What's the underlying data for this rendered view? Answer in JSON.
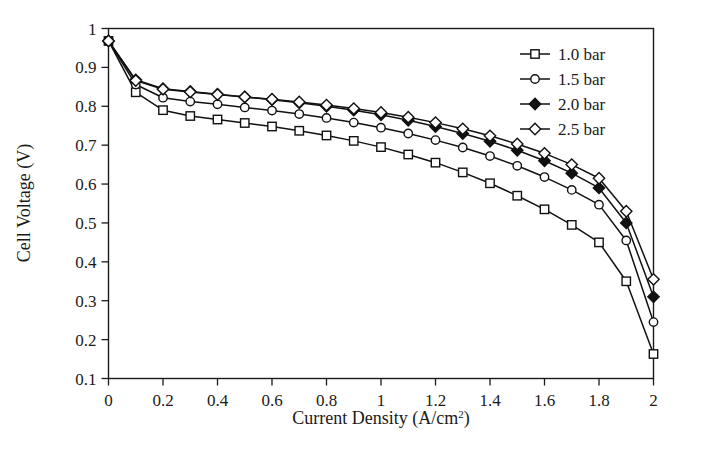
{
  "chart_data": {
    "type": "line",
    "title": "",
    "xlabel": "Current Density (A/cm2)",
    "xlabel_main": "Current Density (A/cm",
    "xlabel_sup": "2",
    "xlabel_tail": ")",
    "ylabel": "Cell Voltage (V)",
    "xlim": [
      0,
      2
    ],
    "ylim": [
      0.1,
      1
    ],
    "grid": false,
    "legend_position": "top-right",
    "xticks": [
      "0",
      "0.2",
      "0.4",
      "0.6",
      "0.8",
      "1",
      "1.2",
      "1.4",
      "1.6",
      "1.8",
      "2"
    ],
    "xtick_values": [
      0,
      0.2,
      0.4,
      0.6,
      0.8,
      1,
      1.2,
      1.4,
      1.6,
      1.8,
      2
    ],
    "yticks": [
      "0.1",
      "0.2",
      "0.3",
      "0.4",
      "0.5",
      "0.6",
      "0.7",
      "0.8",
      "0.9",
      "1"
    ],
    "ytick_values": [
      0.1,
      0.2,
      0.3,
      0.4,
      0.5,
      0.6,
      0.7,
      0.8,
      0.9,
      1
    ],
    "x": [
      0,
      0.1,
      0.2,
      0.3,
      0.4,
      0.5,
      0.6,
      0.7,
      0.8,
      0.9,
      1.0,
      1.1,
      1.2,
      1.3,
      1.4,
      1.5,
      1.6,
      1.7,
      1.8,
      1.9,
      2.0
    ],
    "series": [
      {
        "name": "1.0 bar",
        "marker": "open-square",
        "values": [
          0.968,
          0.836,
          0.79,
          0.775,
          0.766,
          0.757,
          0.748,
          0.737,
          0.725,
          0.711,
          0.695,
          0.676,
          0.655,
          0.63,
          0.602,
          0.57,
          0.535,
          0.495,
          0.45,
          0.35,
          0.163
        ]
      },
      {
        "name": "1.5 bar",
        "marker": "open-circle",
        "values": [
          0.968,
          0.856,
          0.822,
          0.812,
          0.805,
          0.797,
          0.789,
          0.78,
          0.77,
          0.758,
          0.745,
          0.73,
          0.713,
          0.694,
          0.672,
          0.647,
          0.618,
          0.585,
          0.547,
          0.455,
          0.245
        ]
      },
      {
        "name": "2.0 bar",
        "marker": "filled-diamond",
        "values": [
          0.968,
          0.868,
          0.845,
          0.838,
          0.831,
          0.824,
          0.817,
          0.809,
          0.8,
          0.79,
          0.778,
          0.764,
          0.748,
          0.73,
          0.71,
          0.687,
          0.66,
          0.628,
          0.59,
          0.5,
          0.31
        ]
      },
      {
        "name": "2.5 bar",
        "marker": "open-diamond",
        "values": [
          0.968,
          0.866,
          0.844,
          0.837,
          0.83,
          0.824,
          0.818,
          0.811,
          0.803,
          0.794,
          0.784,
          0.772,
          0.758,
          0.742,
          0.724,
          0.703,
          0.679,
          0.65,
          0.615,
          0.53,
          0.355
        ]
      }
    ]
  },
  "legend": {
    "items": [
      {
        "label": "1.0 bar",
        "marker": "open-square"
      },
      {
        "label": "1.5 bar",
        "marker": "open-circle"
      },
      {
        "label": "2.0 bar",
        "marker": "filled-diamond"
      },
      {
        "label": "2.5 bar",
        "marker": "open-diamond"
      }
    ]
  },
  "colors": {
    "line": "#111111",
    "frame": "#1a1a1a",
    "background": "#ffffff",
    "marker_fill_open": "#ffffff"
  }
}
